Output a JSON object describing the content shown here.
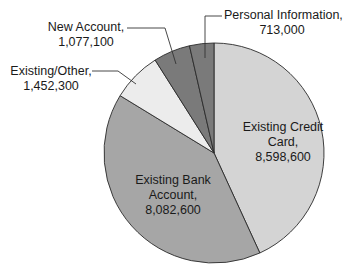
{
  "chart_data": {
    "type": "pie",
    "title": "",
    "start_angle_deg": 0,
    "direction": "clockwise",
    "total": 19923600,
    "slices": [
      {
        "label": "Existing Credit Card",
        "value": 8598600,
        "display_value": "8,598,600",
        "color": "#d4d4d4"
      },
      {
        "label": "Existing Bank Account",
        "value": 8082600,
        "display_value": "8,082,600",
        "color": "#a6a6a6"
      },
      {
        "label": "Existing/Other",
        "value": 1452300,
        "display_value": "1,452,300",
        "color": "#ececec"
      },
      {
        "label": "New Account",
        "value": 1077100,
        "display_value": "1,077,100",
        "color": "#7a7a7a"
      },
      {
        "label": "Personal Information",
        "value": 713000,
        "display_value": "713,000",
        "color": "#7a7a7a"
      }
    ],
    "legend": "none",
    "labels_inside": [
      "Existing Credit Card",
      "Existing Bank Account"
    ],
    "labels_outside_with_leaders": [
      "Existing/Other",
      "New Account",
      "Personal Information"
    ]
  },
  "labels": {
    "credit": {
      "line1": "Existing Credit",
      "line2": "Card,",
      "line3": "8,598,600"
    },
    "bank": {
      "line1": "Existing Bank",
      "line2": "Account,",
      "line3": "8,082,600"
    },
    "other": {
      "line1": "Existing/Other,",
      "line2": "1,452,300"
    },
    "new_account": {
      "line1": "New Account,",
      "line2": "1,077,100"
    },
    "personal": {
      "line1": "Personal Information,",
      "line2": "713,000"
    }
  }
}
